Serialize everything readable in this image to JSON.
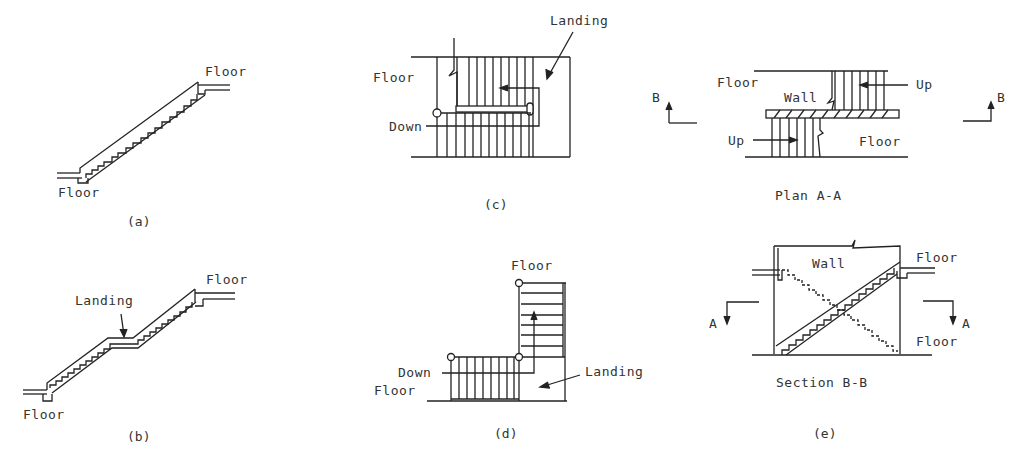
{
  "figure": {
    "panels": [
      {
        "id": "a",
        "caption": "(a)",
        "labels": {
          "top_floor": "Floor",
          "bottom_floor": "Floor"
        },
        "description": "Straight-run stair"
      },
      {
        "id": "b",
        "caption": "(b)",
        "labels": {
          "top_floor": "Floor",
          "bottom_floor": "Floor",
          "landing": "Landing"
        },
        "description": "Straight-run stair with intermediate landing"
      },
      {
        "id": "c",
        "caption": "(c)",
        "labels": {
          "floor": "Floor",
          "down": "Down",
          "landing": "Landing"
        },
        "description": "U-shaped (switchback) stair plan"
      },
      {
        "id": "d",
        "caption": "(d)",
        "labels": {
          "top_floor": "Floor",
          "down": "Down",
          "bottom_floor": "Floor",
          "landing": "Landing"
        },
        "description": "L-shaped stair plan"
      },
      {
        "id": "e",
        "caption": "(e)",
        "labels": {
          "plan_title": "Plan A-A",
          "plan_floor_top": "Floor",
          "plan_floor_bottom": "Floor",
          "plan_wall": "Wall",
          "plan_up_top": "Up",
          "plan_up_bottom": "Up",
          "section_marker_left": "B",
          "section_marker_right": "B",
          "section_title": "Section B-B",
          "section_wall": "Wall",
          "section_floor_top": "Floor",
          "section_floor_bottom": "Floor",
          "cut_marker_left": "A",
          "cut_marker_right": "A"
        },
        "description": "Scissor stair plan and section"
      }
    ]
  }
}
